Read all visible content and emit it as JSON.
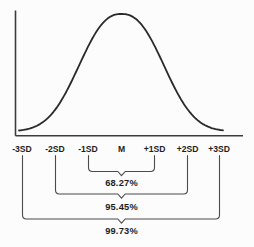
{
  "chart_data": {
    "type": "line",
    "curve_shape": "normal-distribution-bell",
    "title": "",
    "xlabel": "",
    "ylabel": "",
    "grid": false,
    "legend": null,
    "x_tick_labels": [
      "-3SD",
      "-2SD",
      "-1SD",
      "M",
      "+1SD",
      "+2SD",
      "+3SD"
    ],
    "x_values_in_sd": [
      -3,
      -2,
      -1,
      0,
      1,
      2,
      3
    ],
    "peak_at": "M",
    "coverage_annotations": [
      {
        "from_label": "-1SD",
        "to_label": "+1SD",
        "label": "68.27%",
        "value_percent": 68.27
      },
      {
        "from_label": "-2SD",
        "to_label": "+2SD",
        "label": "95.45%",
        "value_percent": 95.45
      },
      {
        "from_label": "-3SD",
        "to_label": "+3SD",
        "label": "99.73%",
        "value_percent": 99.73
      }
    ]
  },
  "colors": {
    "curve": "#2a2a2a",
    "axis": "#3c3c3c",
    "bracket": "#4b4b4b",
    "text": "#1d1d1d",
    "background": "#fcfcfc"
  }
}
